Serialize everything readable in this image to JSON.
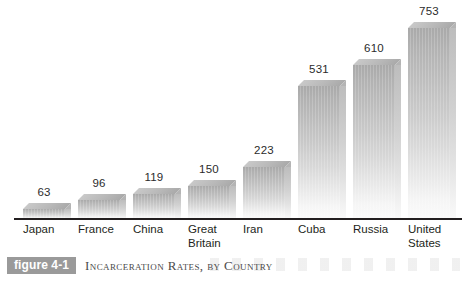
{
  "caption": {
    "badge_label": "figure 4-1",
    "title": "Incarceration Rates, by Country"
  },
  "chart_data": {
    "type": "bar",
    "title": "Incarceration Rates, by Country",
    "xlabel": "",
    "ylabel": "",
    "grid": false,
    "legend": "none",
    "ylim": [
      0,
      800
    ],
    "categories": [
      "Japan",
      "France",
      "China",
      "Great Britain",
      "Iran",
      "Cuba",
      "Russia",
      "United States"
    ],
    "category_lines": [
      [
        "Japan"
      ],
      [
        "France"
      ],
      [
        "China"
      ],
      [
        "Great",
        "Britain"
      ],
      [
        "Iran"
      ],
      [
        "Cuba"
      ],
      [
        "Russia"
      ],
      [
        "United",
        "States"
      ]
    ],
    "values": [
      63,
      96,
      119,
      150,
      223,
      531,
      610,
      753
    ],
    "value_labels": [
      "63",
      "96",
      "119",
      "150",
      "223",
      "531",
      "610",
      "753"
    ],
    "colors": {
      "bar_top": "#a9a9a9",
      "bar_bottom": "#fbfbfb",
      "bar_side": "#cfcfcf",
      "axis": "#231f20",
      "label_text": "#231f20",
      "badge_bg": "#9a9a9a",
      "badge_text": "#ffffff",
      "caption_text": "#4a4a4a",
      "background": "#ffffff"
    }
  }
}
